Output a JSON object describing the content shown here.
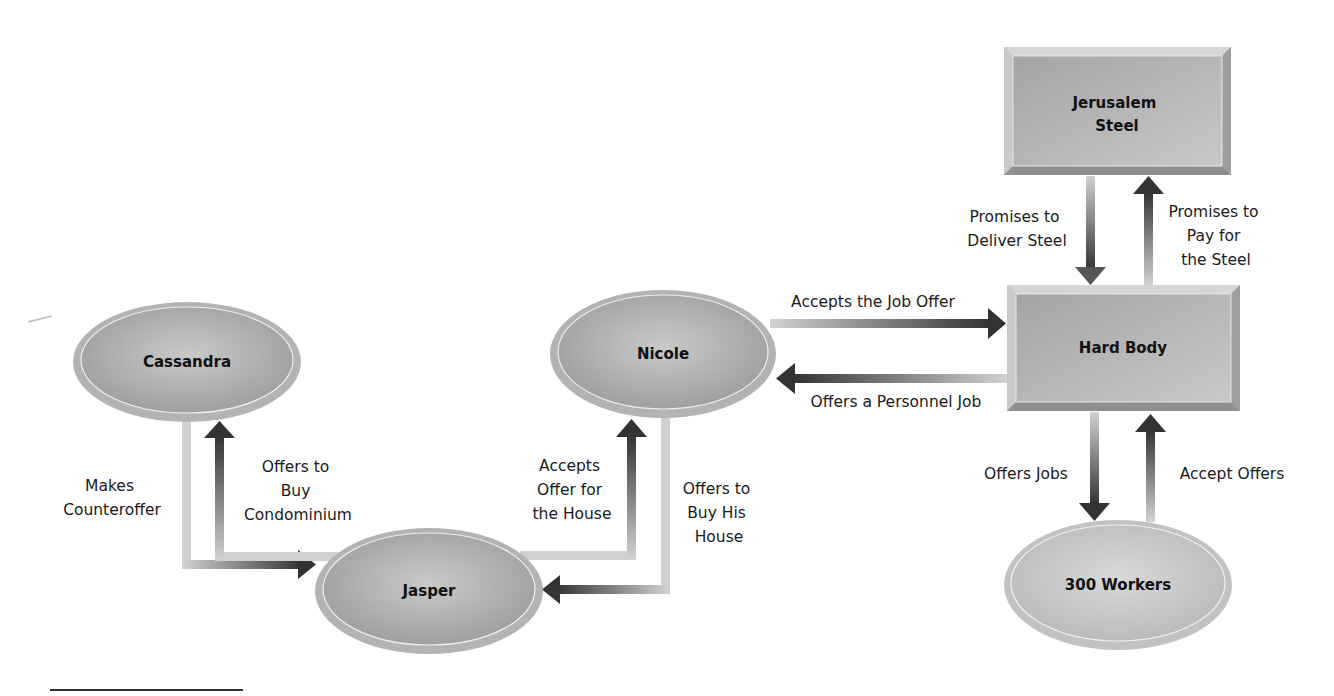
{
  "diagram": {
    "colors": {
      "node_fill_dark": "#9a9a9a",
      "node_fill_light": "#c4c4c4",
      "node_rim": "#b8b8b8",
      "arrow_dark": "#3a3a3a",
      "arrow_light": "#cdcdcd",
      "text": "#111111"
    },
    "nodes": [
      {
        "id": "cassandra",
        "label": "Cassandra",
        "shape": "ellipse",
        "cx": 187,
        "cy": 362,
        "rx": 114,
        "ry": 60
      },
      {
        "id": "jasper",
        "label": "Jasper",
        "shape": "ellipse",
        "cx": 429,
        "cy": 591,
        "rx": 114,
        "ry": 63
      },
      {
        "id": "nicole",
        "label": "Nicole",
        "shape": "ellipse",
        "cx": 663,
        "cy": 354,
        "rx": 113,
        "ry": 64
      },
      {
        "id": "hard_body",
        "label": "Hard Body",
        "shape": "rect",
        "x": 1007,
        "y": 285,
        "w": 233,
        "h": 126
      },
      {
        "id": "jerusalem_steel",
        "label_lines": [
          "Jerusalem",
          "Steel"
        ],
        "shape": "rect",
        "x": 1004,
        "y": 47,
        "w": 227,
        "h": 128
      },
      {
        "id": "workers",
        "label": "300 Workers",
        "shape": "ellipse",
        "cx": 1118,
        "cy": 585,
        "rx": 114,
        "ry": 65
      }
    ],
    "edges": [
      {
        "id": "makes-counteroffer",
        "from": "cassandra",
        "to": "jasper",
        "label_lines": [
          "Makes",
          "Counteroffer"
        ]
      },
      {
        "id": "offers-to-buy-condominium",
        "from": "jasper",
        "to": "cassandra",
        "label_lines": [
          "Offers to",
          "Buy",
          "Condominium"
        ]
      },
      {
        "id": "accepts-offer-for-house",
        "from": "jasper",
        "to": "nicole",
        "label_lines": [
          "Accepts",
          "Offer for",
          "the House"
        ]
      },
      {
        "id": "offers-to-buy-his-house",
        "from": "nicole",
        "to": "jasper",
        "label_lines": [
          "Offers to",
          "Buy His",
          "House"
        ]
      },
      {
        "id": "accepts-the-job-offer",
        "from": "nicole",
        "to": "hard_body",
        "label_lines": [
          "Accepts the Job Offer"
        ]
      },
      {
        "id": "offers-a-personnel-job",
        "from": "hard_body",
        "to": "nicole",
        "label_lines": [
          "Offers a Personnel Job"
        ]
      },
      {
        "id": "promises-to-deliver-steel",
        "from": "jerusalem_steel",
        "to": "hard_body",
        "label_lines": [
          "Promises to",
          "Deliver Steel"
        ]
      },
      {
        "id": "promises-to-pay-for-steel",
        "from": "hard_body",
        "to": "jerusalem_steel",
        "label_lines": [
          "Promises to",
          "Pay for",
          "the Steel"
        ]
      },
      {
        "id": "offers-jobs",
        "from": "hard_body",
        "to": "workers",
        "label_lines": [
          "Offers Jobs"
        ]
      },
      {
        "id": "accept-offers",
        "from": "workers",
        "to": "hard_body",
        "label_lines": [
          "Accept Offers"
        ]
      }
    ]
  }
}
